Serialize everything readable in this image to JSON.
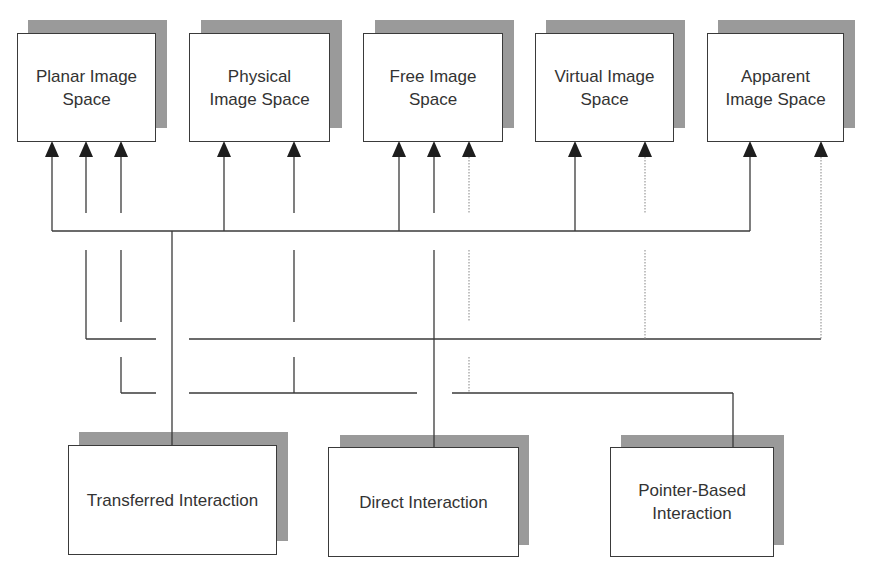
{
  "diagram": {
    "colors": {
      "line": "#3a3a3a",
      "shadow": "#9a9a9a",
      "dotted": "#9a9a9a",
      "text": "#333333"
    },
    "image_spaces": [
      {
        "id": "planar",
        "label": "Planar Image\nSpace"
      },
      {
        "id": "physical",
        "label": "Physical\nImage Space"
      },
      {
        "id": "free",
        "label": "Free Image\nSpace"
      },
      {
        "id": "virtual",
        "label": "Virtual Image\nSpace"
      },
      {
        "id": "apparent",
        "label": "Apparent\nImage Space"
      }
    ],
    "interaction_types": [
      {
        "id": "transferred",
        "label": "Transferred Interaction"
      },
      {
        "id": "direct",
        "label": "Direct Interaction"
      },
      {
        "id": "pointer",
        "label": "Pointer-Based\nInteraction"
      }
    ],
    "connections": {
      "transferred": [
        "planar",
        "physical",
        "free",
        "virtual",
        "apparent"
      ],
      "direct": [
        "planar",
        "free",
        "virtual",
        "apparent"
      ],
      "pointer": [
        "planar",
        "physical",
        "free"
      ],
      "dotted_links": [
        "free (pointer)",
        "virtual (direct)",
        "apparent (direct)"
      ]
    }
  }
}
